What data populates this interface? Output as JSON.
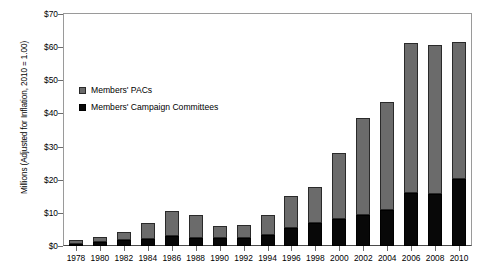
{
  "chart_data": {
    "type": "bar",
    "stacked": true,
    "title": "",
    "xlabel": "",
    "ylabel": "Millions (Adjusted for Inflation, 2010 = 1.00)",
    "ylim": [
      0,
      70
    ],
    "ytick_values": [
      0,
      10,
      20,
      30,
      40,
      50,
      60,
      70
    ],
    "ytick_labels": [
      "$0",
      "$10",
      "$20",
      "$30",
      "$40",
      "$50",
      "$60",
      "$70"
    ],
    "grid": false,
    "legend_position": "upper-left-inside",
    "categories": [
      "1978",
      "1980",
      "1982",
      "1984",
      "1986",
      "1988",
      "1990",
      "1992",
      "1994",
      "1996",
      "1998",
      "2000",
      "2002",
      "2004",
      "2006",
      "2008",
      "2010"
    ],
    "series": [
      {
        "name": "Members' Campaign Committees",
        "color": "#080808",
        "values": [
          0.6,
          1.2,
          1.8,
          2.1,
          2.9,
          2.5,
          2.3,
          2.4,
          3.4,
          5.4,
          6.9,
          8.2,
          9.4,
          10.8,
          16.0,
          15.6,
          20.2
        ]
      },
      {
        "name": "Members' PACs",
        "color": "#6b6b6b",
        "values": [
          1.1,
          1.6,
          2.4,
          4.8,
          7.8,
          6.9,
          3.7,
          3.8,
          6.1,
          9.6,
          11.0,
          19.8,
          29.3,
          32.7,
          45.3,
          45.0,
          41.4
        ]
      }
    ],
    "totals": [
      1.7,
      2.8,
      4.2,
      6.9,
      10.7,
      9.4,
      6.0,
      6.2,
      9.5,
      15.0,
      17.9,
      28.0,
      38.7,
      43.5,
      61.3,
      60.6,
      61.6
    ]
  },
  "legend": {
    "entries": [
      {
        "label": "Members' PACs",
        "swatch": "gray-square-icon"
      },
      {
        "label": "Members' Campaign Committees",
        "swatch": "black-square-icon"
      }
    ]
  }
}
